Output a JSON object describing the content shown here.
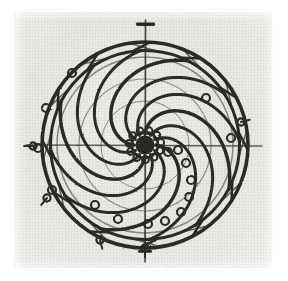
{
  "figure": {
    "caption": "",
    "medium": "engraving",
    "ink_color": "#2b2a28",
    "paper_color": "#ecebea",
    "background_color": "#ffffff"
  },
  "canvas": {
    "width": 288,
    "height": 281
  },
  "paper": {
    "x": 14,
    "y": 12,
    "width": 258,
    "height": 256
  },
  "wheel": {
    "center_x": 145,
    "center_y": 145,
    "outer_rim_radius": 103,
    "inner_rim_radius": 95,
    "hub_radius": 13,
    "rim_stroke": 3.4,
    "arm_stroke": 3.0,
    "arm_count": 12,
    "arm_turn_degrees": 118,
    "arm_start_radius": 11,
    "arm_end_radius": 95,
    "spiral_direction": "clockwise"
  },
  "rim_braces": {
    "count": 12,
    "note": "short diagonal struts between inner and outer rim where each arm lands"
  },
  "axle": {
    "top_y": 20,
    "bottom_y": 262,
    "stroke": 1.6,
    "cap_top": {
      "y": 24,
      "half_width": 9,
      "thickness": 3.2
    },
    "cap_bottom": {
      "y": 252,
      "half_width": 7,
      "thickness": 2.6
    }
  },
  "cross_axis": {
    "horizontal_y": 145,
    "left_x": 26,
    "right_x": 262,
    "stroke": 1.3
  },
  "hub_rings": {
    "count": 11,
    "orbit_radius": 16,
    "ring_radius": 3.4,
    "stroke": 2.0
  },
  "weight_markers": {
    "label": "ring weights along loaded spiral",
    "ring_radius": 4.0,
    "stroke": 2.2,
    "points": [
      {
        "x": 168,
        "y": 152
      },
      {
        "x": 178,
        "y": 150
      },
      {
        "x": 186,
        "y": 163
      },
      {
        "x": 191,
        "y": 180
      },
      {
        "x": 189,
        "y": 197
      },
      {
        "x": 181,
        "y": 212
      },
      {
        "x": 165,
        "y": 221
      },
      {
        "x": 148,
        "y": 224
      },
      {
        "x": 118,
        "y": 219
      },
      {
        "x": 95,
        "y": 205
      },
      {
        "x": 52,
        "y": 190
      },
      {
        "x": 38,
        "y": 148
      },
      {
        "x": 46,
        "y": 108
      },
      {
        "x": 72,
        "y": 73
      },
      {
        "x": 206,
        "y": 98
      },
      {
        "x": 231,
        "y": 138
      }
    ]
  },
  "rim_nubs": {
    "label": "external pegs / pivot stubs on rim",
    "items": [
      {
        "x": 33,
        "y": 146,
        "angle": 180
      },
      {
        "x": 47,
        "y": 198,
        "angle": 130
      },
      {
        "x": 100,
        "y": 240,
        "angle": 75
      },
      {
        "x": 145,
        "y": 248,
        "angle": 90
      },
      {
        "x": 241,
        "y": 122,
        "angle": 345
      }
    ]
  },
  "inner_secondary_circles": {
    "label": "faint secondary arcs inside the rim",
    "radii": [
      88,
      66,
      44
    ]
  }
}
